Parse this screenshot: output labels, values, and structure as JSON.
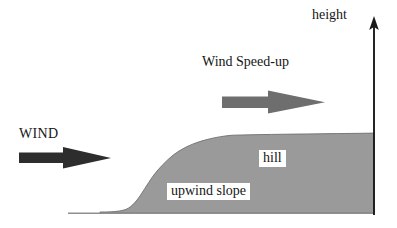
{
  "figure": {
    "kind": "schematic-diagram",
    "background_color": "#ffffff"
  },
  "axis": {
    "vertical": {
      "label": "height",
      "color": "#1a1a1a",
      "x": 374,
      "y_top": 20,
      "y_bottom": 215,
      "arrowhead": "up"
    },
    "ground": {
      "color": "#8f8f8f",
      "y": 213,
      "x_start": 68,
      "x_end": 374
    }
  },
  "terrain": {
    "name": "hill",
    "fill_color": "#9a9a9a",
    "outline_color": "#6f6f6f",
    "base_y": 213,
    "crest_y": 134,
    "flat_start_x": 100,
    "rise_start_x": 128,
    "crest_start_x": 228,
    "right_edge_x": 374,
    "profile_points": [
      [
        100,
        212
      ],
      [
        122,
        211
      ],
      [
        132,
        206
      ],
      [
        142,
        194
      ],
      [
        152,
        180
      ],
      [
        163,
        166
      ],
      [
        175,
        155
      ],
      [
        188,
        147
      ],
      [
        202,
        141
      ],
      [
        216,
        137
      ],
      [
        230,
        135
      ],
      [
        260,
        135
      ],
      [
        300,
        134
      ],
      [
        340,
        134
      ],
      [
        374,
        133
      ]
    ]
  },
  "arrows": [
    {
      "id": "wind-arrow",
      "label": "WIND",
      "color": "#2d2d2d",
      "shaft": {
        "x": 19,
        "y": 152,
        "width": 47,
        "height": 11
      },
      "head": {
        "tip_x": 111,
        "base_x": 63,
        "half_height": 11
      },
      "direction": "right"
    },
    {
      "id": "wind-speedup-arrow",
      "label": "Wind Speed-up",
      "color": "#6e6e6e",
      "shaft": {
        "x": 222,
        "y": 96,
        "width": 50,
        "height": 12
      },
      "head": {
        "tip_x": 325,
        "base_x": 268,
        "half_height": 11
      },
      "direction": "right"
    }
  ],
  "labels": {
    "height": "height",
    "wind": "WIND",
    "wind_speedup": "Wind Speed-up",
    "hill": "hill",
    "upwind_slope": "upwind slope"
  },
  "colors": {
    "text": "#151515",
    "hill_fill": "#9a9a9a",
    "hill_outline": "#6f6f6f",
    "axis": "#1a1a1a",
    "ground": "#8f8f8f",
    "arrow_dark": "#2d2d2d",
    "arrow_gray": "#6e6e6e",
    "label_box_bg": "#ffffff"
  }
}
